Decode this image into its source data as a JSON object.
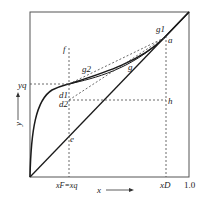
{
  "diagram": {
    "type": "McCabe-Thiele x-y equilibrium diagram",
    "axes": {
      "x_label": "x",
      "y_label": "y",
      "x_max_label": "1.0"
    },
    "tick_labels": {
      "xF": "xF=xq",
      "xD": "xD",
      "yq": "yq"
    },
    "points": {
      "f": "f",
      "g2": "g2",
      "g": "g",
      "g1": "g1",
      "a": "a",
      "d1": "d1",
      "d2": "d2",
      "h": "h",
      "e": "e"
    },
    "colors": {
      "line": "#1a1a1a",
      "frame": "#555555",
      "dashed": "#444444"
    }
  }
}
